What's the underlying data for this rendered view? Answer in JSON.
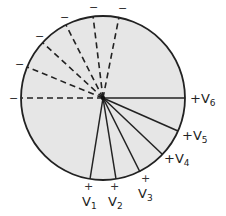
{
  "diagram": {
    "colors": {
      "fill": "#e6e6e6",
      "stroke": "#222222",
      "background": "#ffffff"
    },
    "negative_terminals": [
      {
        "sign": "−"
      },
      {
        "sign": "−"
      },
      {
        "sign": "−"
      },
      {
        "sign": "−"
      },
      {
        "sign": "−"
      },
      {
        "sign": "−"
      }
    ],
    "positive_terminals": [
      {
        "sign": "+",
        "label": "V",
        "sub": "1"
      },
      {
        "sign": "+",
        "label": "V",
        "sub": "2"
      },
      {
        "sign": "+",
        "label": "V",
        "sub": "3"
      },
      {
        "sign": "+",
        "label": "V",
        "sub": "4"
      },
      {
        "sign": "+",
        "label": "V",
        "sub": "5"
      },
      {
        "sign": "+",
        "label": "V",
        "sub": "6"
      }
    ]
  }
}
